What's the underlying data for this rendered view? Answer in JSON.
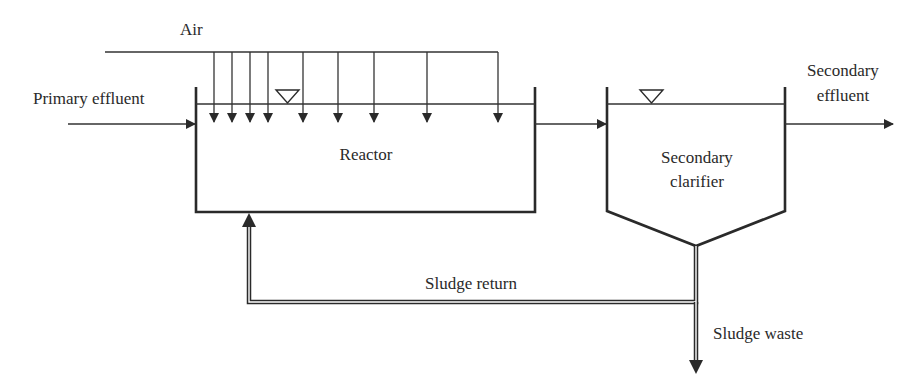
{
  "diagram": {
    "type": "activated-sludge-process-flow",
    "labels": {
      "air": "Air",
      "primary_effluent": "Primary effluent",
      "reactor": "Reactor",
      "clarifier_line1": "Secondary",
      "clarifier_line2": "clarifier",
      "secondary_effluent_line1": "Secondary",
      "secondary_effluent_line2": "effluent",
      "sludge_return": "Sludge return",
      "sludge_waste": "Sludge waste"
    },
    "nodes": [
      {
        "id": "reactor",
        "label": "Reactor"
      },
      {
        "id": "clarifier",
        "label": "Secondary clarifier"
      }
    ],
    "edges": [
      {
        "from": "Primary effluent",
        "to": "reactor"
      },
      {
        "from": "Air",
        "to": "reactor",
        "diffusers": 8
      },
      {
        "from": "reactor",
        "to": "clarifier"
      },
      {
        "from": "clarifier",
        "to": "Secondary effluent"
      },
      {
        "from": "clarifier",
        "to": "reactor",
        "label": "Sludge return"
      },
      {
        "from": "clarifier",
        "to": "Sludge waste"
      }
    ],
    "colors": {
      "line": "#2a2a2a",
      "background": "#ffffff"
    }
  }
}
